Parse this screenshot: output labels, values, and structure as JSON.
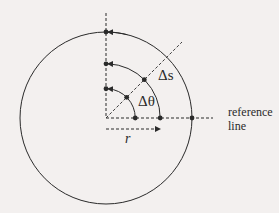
{
  "diagram": {
    "labels": {
      "delta_s": "Δs",
      "delta_theta": "Δθ",
      "radius": "r",
      "reference_line_1": "reference",
      "reference_line_2": "line"
    },
    "colors": {
      "background": "#f3f0ef",
      "ink": "#2a2a2a"
    },
    "arc_radius_fractions": [
      0.34,
      0.63,
      1.0
    ],
    "ray_angle_deg": 45,
    "arc_span_deg": 90
  }
}
